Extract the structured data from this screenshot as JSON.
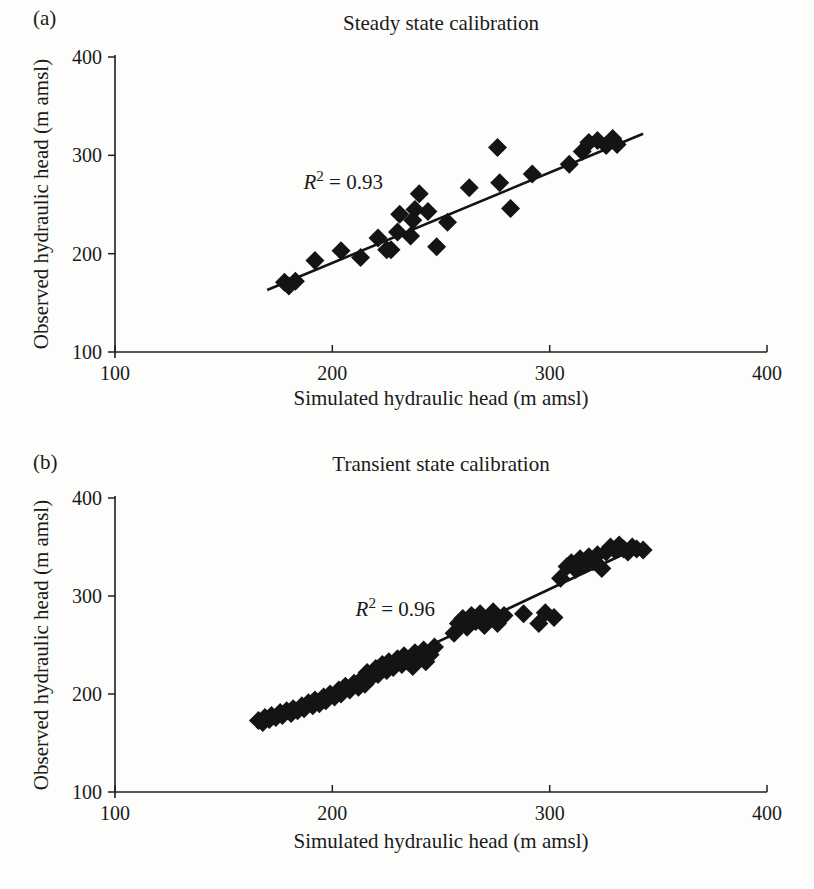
{
  "chart_data": [
    {
      "type": "scatter",
      "panel_label": "(a)",
      "title": "Steady state calibration",
      "xlabel": "Simulated hydraulic head (m amsl)",
      "ylabel": "Observed hydraulic head (m amsl)",
      "xlim": [
        100,
        400
      ],
      "ylim": [
        100,
        400
      ],
      "xticks": [
        100,
        200,
        300,
        400
      ],
      "yticks": [
        100,
        200,
        300,
        400
      ],
      "grid": false,
      "legend": "none",
      "marker": {
        "shape": "diamond",
        "color": "#141414"
      },
      "line_color": "#141414",
      "annotation": {
        "var": "R",
        "exp": "2",
        "rest": " = 0.93",
        "x": 205,
        "y": 274
      },
      "trendline": {
        "x1": 170,
        "y1": 163,
        "x2": 343,
        "y2": 322
      },
      "points": [
        [
          178,
          171
        ],
        [
          180,
          167
        ],
        [
          183,
          172
        ],
        [
          192,
          193
        ],
        [
          204,
          203
        ],
        [
          213,
          196
        ],
        [
          221,
          216
        ],
        [
          225,
          204
        ],
        [
          227,
          204
        ],
        [
          230,
          222
        ],
        [
          231,
          240
        ],
        [
          236,
          218
        ],
        [
          237,
          234
        ],
        [
          238,
          245
        ],
        [
          240,
          261
        ],
        [
          244,
          243
        ],
        [
          248,
          207
        ],
        [
          253,
          232
        ],
        [
          263,
          267
        ],
        [
          276,
          308
        ],
        [
          277,
          272
        ],
        [
          282,
          246
        ],
        [
          292,
          281
        ],
        [
          309,
          291
        ],
        [
          315,
          304
        ],
        [
          318,
          313
        ],
        [
          322,
          315
        ],
        [
          326,
          310
        ],
        [
          329,
          317
        ],
        [
          331,
          311
        ]
      ]
    },
    {
      "type": "scatter",
      "panel_label": "(b)",
      "title": "Transient state calibration",
      "xlabel": "Simulated hydraulic head (m amsl)",
      "ylabel": "Observed hydraulic head (m amsl)",
      "xlim": [
        100,
        400
      ],
      "ylim": [
        100,
        400
      ],
      "xticks": [
        100,
        200,
        300,
        400
      ],
      "yticks": [
        100,
        200,
        300,
        400
      ],
      "grid": false,
      "legend": "none",
      "marker": {
        "shape": "diamond",
        "color": "#141414"
      },
      "line_color": "#141414",
      "annotation": {
        "var": "R",
        "exp": "2",
        "rest": " = 0.96",
        "x": 229,
        "y": 288
      },
      "trendline": {
        "x1": 167,
        "y1": 168,
        "x2": 342,
        "y2": 351
      },
      "points": [
        [
          166,
          173
        ],
        [
          168,
          171
        ],
        [
          169,
          176
        ],
        [
          171,
          174
        ],
        [
          172,
          178
        ],
        [
          174,
          176
        ],
        [
          176,
          181
        ],
        [
          177,
          178
        ],
        [
          179,
          183
        ],
        [
          181,
          180
        ],
        [
          182,
          185
        ],
        [
          184,
          183
        ],
        [
          186,
          188
        ],
        [
          187,
          185
        ],
        [
          189,
          191
        ],
        [
          191,
          188
        ],
        [
          192,
          194
        ],
        [
          194,
          190
        ],
        [
          196,
          197
        ],
        [
          197,
          193
        ],
        [
          199,
          200
        ],
        [
          201,
          197
        ],
        [
          203,
          204
        ],
        [
          204,
          200
        ],
        [
          206,
          208
        ],
        [
          208,
          204
        ],
        [
          210,
          211
        ],
        [
          212,
          207
        ],
        [
          213,
          214
        ],
        [
          215,
          210
        ],
        [
          216,
          222
        ],
        [
          218,
          217
        ],
        [
          220,
          226
        ],
        [
          221,
          220
        ],
        [
          223,
          230
        ],
        [
          225,
          224
        ],
        [
          226,
          233
        ],
        [
          228,
          227
        ],
        [
          230,
          236
        ],
        [
          232,
          230
        ],
        [
          233,
          239
        ],
        [
          235,
          233
        ],
        [
          237,
          228
        ],
        [
          238,
          242
        ],
        [
          240,
          236
        ],
        [
          242,
          245
        ],
        [
          243,
          233
        ],
        [
          245,
          240
        ],
        [
          247,
          248
        ],
        [
          256,
          262
        ],
        [
          258,
          272
        ],
        [
          260,
          277
        ],
        [
          262,
          268
        ],
        [
          264,
          280
        ],
        [
          266,
          274
        ],
        [
          268,
          282
        ],
        [
          270,
          270
        ],
        [
          272,
          278
        ],
        [
          274,
          284
        ],
        [
          276,
          272
        ],
        [
          279,
          280
        ],
        [
          288,
          282
        ],
        [
          295,
          272
        ],
        [
          298,
          283
        ],
        [
          302,
          278
        ],
        [
          305,
          318
        ],
        [
          308,
          330
        ],
        [
          310,
          334
        ],
        [
          312,
          327
        ],
        [
          314,
          338
        ],
        [
          316,
          332
        ],
        [
          318,
          340
        ],
        [
          320,
          335
        ],
        [
          322,
          342
        ],
        [
          324,
          328
        ],
        [
          326,
          345
        ],
        [
          328,
          350
        ],
        [
          330,
          347
        ],
        [
          332,
          352
        ],
        [
          334,
          348
        ],
        [
          336,
          345
        ],
        [
          338,
          350
        ],
        [
          340,
          348
        ],
        [
          343,
          347
        ]
      ]
    }
  ]
}
